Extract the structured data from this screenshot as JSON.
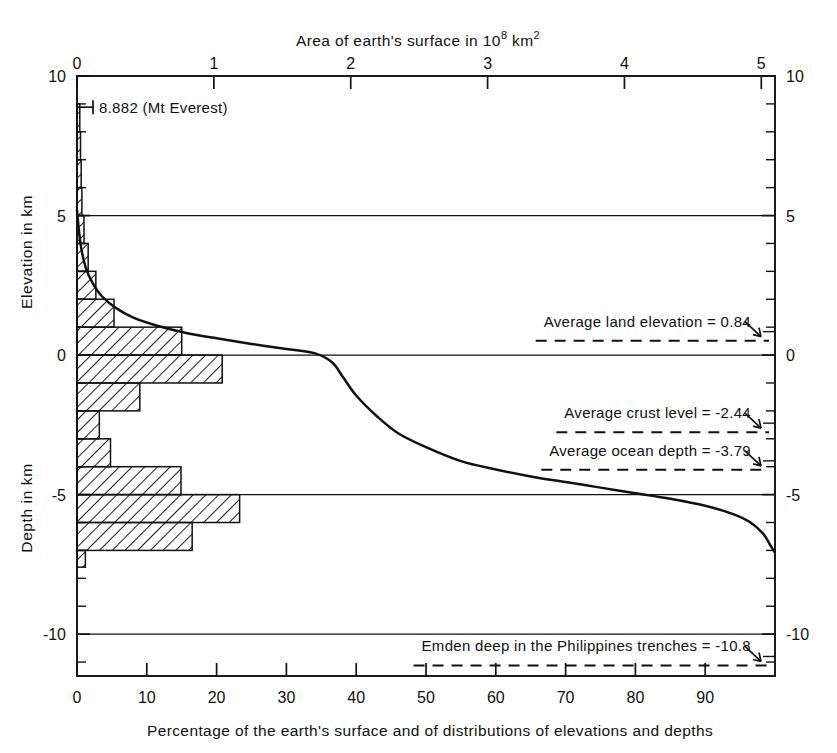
{
  "chart_data": {
    "type": "area",
    "title": "",
    "top_axis": {
      "label": "Area of earth's surface in 10",
      "label_sup": "8",
      "label_tail": " km",
      "label_tail_sup": "2",
      "ticks": [
        0,
        1,
        2,
        3,
        4,
        5
      ],
      "tick_labels": [
        "0",
        "1",
        "2",
        "3",
        "4",
        "5"
      ],
      "range": [
        0,
        5.1
      ]
    },
    "bottom_axis": {
      "label": "Percentage of the earth's surface and of distributions of elevations and depths",
      "ticks": [
        0,
        10,
        20,
        30,
        40,
        50,
        60,
        70,
        80,
        90
      ],
      "tick_labels": [
        "0",
        "10",
        "20",
        "30",
        "40",
        "50",
        "60",
        "70",
        "80",
        "90"
      ],
      "range": [
        0,
        100
      ]
    },
    "left_axis": {
      "label_upper": "Elevation in km",
      "label_lower": "Depth in km",
      "ticks": [
        10,
        5,
        0,
        -5,
        -10
      ],
      "tick_labels": [
        "10",
        "5",
        "0",
        "-5",
        "-10"
      ],
      "minor_tick_step": 1,
      "range": [
        -11.5,
        10
      ]
    },
    "right_axis": {
      "ticks": [
        10,
        5,
        0,
        -5,
        -10
      ],
      "tick_labels": [
        "10",
        "5",
        "0",
        "-5",
        "-10"
      ]
    },
    "gridlines_at": [
      5,
      0,
      -5,
      -10
    ],
    "grid": true,
    "legend": "none",
    "xlabel": "Percentage of the earth's surface and of distributions of elevations and depths",
    "ylabel": "Elevation in km / Depth in km",
    "histogram": {
      "name": "Area distribution of elevations and depths",
      "xlabel_units": "percent of earth's surface per 1 km elevation interval",
      "bins": [
        {
          "top_km": 9,
          "bottom_km": 8,
          "percent": 0.4
        },
        {
          "top_km": 8,
          "bottom_km": 7,
          "percent": 0.5
        },
        {
          "top_km": 7,
          "bottom_km": 6,
          "percent": 0.6
        },
        {
          "top_km": 6,
          "bottom_km": 5,
          "percent": 0.7
        },
        {
          "top_km": 5,
          "bottom_km": 4,
          "percent": 1.0
        },
        {
          "top_km": 4,
          "bottom_km": 3,
          "percent": 1.6
        },
        {
          "top_km": 3,
          "bottom_km": 2,
          "percent": 2.7
        },
        {
          "top_km": 2,
          "bottom_km": 1,
          "percent": 5.3
        },
        {
          "top_km": 1,
          "bottom_km": 0,
          "percent": 15.0
        },
        {
          "top_km": 0,
          "bottom_km": -1,
          "percent": 20.8
        },
        {
          "top_km": -1,
          "bottom_km": -2,
          "percent": 9.0
        },
        {
          "top_km": -2,
          "bottom_km": -3,
          "percent": 3.2
        },
        {
          "top_km": -3,
          "bottom_km": -4,
          "percent": 4.8
        },
        {
          "top_km": -4,
          "bottom_km": -5,
          "percent": 14.9
        },
        {
          "top_km": -5,
          "bottom_km": -6,
          "percent": 23.3
        },
        {
          "top_km": -6,
          "bottom_km": -7,
          "percent": 16.5
        },
        {
          "top_km": -7,
          "bottom_km": -7.6,
          "percent": 1.2
        }
      ]
    },
    "hypsometric_curve": {
      "name": "Cumulative hypsometric curve",
      "points": [
        {
          "percent": 0.0,
          "elevation_km": 5.2
        },
        {
          "percent": 0.3,
          "elevation_km": 4.4
        },
        {
          "percent": 0.7,
          "elevation_km": 3.7
        },
        {
          "percent": 1.3,
          "elevation_km": 3.1
        },
        {
          "percent": 2.2,
          "elevation_km": 2.6
        },
        {
          "percent": 3.6,
          "elevation_km": 2.1
        },
        {
          "percent": 5.5,
          "elevation_km": 1.7
        },
        {
          "percent": 8.0,
          "elevation_km": 1.35
        },
        {
          "percent": 11.5,
          "elevation_km": 1.05
        },
        {
          "percent": 15.5,
          "elevation_km": 0.8
        },
        {
          "percent": 20.0,
          "elevation_km": 0.6
        },
        {
          "percent": 25.0,
          "elevation_km": 0.4
        },
        {
          "percent": 30.0,
          "elevation_km": 0.22
        },
        {
          "percent": 34.0,
          "elevation_km": 0.07
        },
        {
          "percent": 36.5,
          "elevation_km": -0.25
        },
        {
          "percent": 38.0,
          "elevation_km": -0.75
        },
        {
          "percent": 40.0,
          "elevation_km": -1.45
        },
        {
          "percent": 43.0,
          "elevation_km": -2.2
        },
        {
          "percent": 46.0,
          "elevation_km": -2.8
        },
        {
          "percent": 50.0,
          "elevation_km": -3.3
        },
        {
          "percent": 55.0,
          "elevation_km": -3.8
        },
        {
          "percent": 60.0,
          "elevation_km": -4.1
        },
        {
          "percent": 65.0,
          "elevation_km": -4.35
        },
        {
          "percent": 70.0,
          "elevation_km": -4.55
        },
        {
          "percent": 75.0,
          "elevation_km": -4.75
        },
        {
          "percent": 80.0,
          "elevation_km": -4.95
        },
        {
          "percent": 85.0,
          "elevation_km": -5.15
        },
        {
          "percent": 90.0,
          "elevation_km": -5.4
        },
        {
          "percent": 94.0,
          "elevation_km": -5.7
        },
        {
          "percent": 96.5,
          "elevation_km": -6.0
        },
        {
          "percent": 98.3,
          "elevation_km": -6.4
        },
        {
          "percent": 99.3,
          "elevation_km": -6.8
        },
        {
          "percent": 99.9,
          "elevation_km": -7.05
        }
      ]
    },
    "annotations": [
      {
        "id": "mt-everest",
        "text": "8.882 (Mt Everest)",
        "elevation_km": 8.882,
        "style": "tick-left-label"
      },
      {
        "id": "average-land-elevation",
        "text": "Average land elevation = 0.84",
        "elevation_km": 0.84,
        "style": "dashed-arrow-right"
      },
      {
        "id": "average-crust-level",
        "text": "Average crust level = -2.44",
        "elevation_km": -2.44,
        "style": "dashed-arrow-right"
      },
      {
        "id": "average-ocean-depth",
        "text": "Average ocean depth = -3.79",
        "elevation_km": -3.79,
        "style": "dashed-arrow-right"
      },
      {
        "id": "emden-deep",
        "text": "Emden deep in the Philippines trenches = -10.8",
        "elevation_km": -10.8,
        "style": "dashed-arrow-right"
      }
    ],
    "colors": {
      "ink": "#111111",
      "background": "#ffffff",
      "hatch": "#111111"
    }
  }
}
